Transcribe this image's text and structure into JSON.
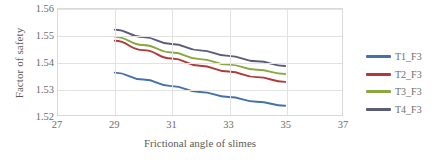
{
  "chart_data": {
    "type": "line",
    "title": "",
    "xlabel": "Frictional angle of slimes",
    "ylabel": "Factor of safety",
    "xlim": [
      27,
      37
    ],
    "ylim": [
      1.52,
      1.56
    ],
    "xticks": [
      27,
      29,
      31,
      33,
      35,
      37
    ],
    "yticks": [
      "1.52",
      "1.53",
      "1.54",
      "1.55",
      "1.56"
    ],
    "grid": true,
    "legend_position": "right",
    "x": [
      29,
      30,
      31,
      32,
      33,
      34,
      35
    ],
    "series": [
      {
        "name": "T1_F3",
        "color": "#4472a8",
        "values": [
          1.536,
          1.5334,
          1.5309,
          1.5287,
          1.5268,
          1.525,
          1.5235
        ]
      },
      {
        "name": "T2_F3",
        "color": "#b03a3a",
        "values": [
          1.548,
          1.5445,
          1.5413,
          1.5386,
          1.5364,
          1.5343,
          1.5325
        ]
      },
      {
        "name": "T3_F3",
        "color": "#8aa840",
        "values": [
          1.5495,
          1.5464,
          1.5436,
          1.5411,
          1.539,
          1.5371,
          1.5355
        ]
      },
      {
        "name": "T4_F3",
        "color": "#5b5b7a",
        "values": [
          1.5522,
          1.5494,
          1.5468,
          1.5444,
          1.5423,
          1.5403,
          1.5385
        ]
      }
    ]
  },
  "legend": {
    "items": [
      {
        "label": "T1_F3",
        "color": "#4472a8"
      },
      {
        "label": "T2_F3",
        "color": "#b03a3a"
      },
      {
        "label": "T3_F3",
        "color": "#8aa840"
      },
      {
        "label": "T4_F3",
        "color": "#5b5b7a"
      }
    ]
  },
  "axes": {
    "y_title": "Factor of safety",
    "x_title": "Frictional angle of slimes"
  }
}
